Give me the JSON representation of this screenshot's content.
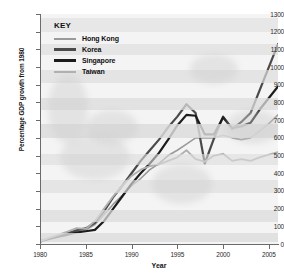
{
  "chart_data": {
    "type": "line",
    "title": "",
    "xlabel": "Year",
    "ylabel": "Percentage GDP growth from 1980",
    "xlim": [
      1980,
      2006
    ],
    "ylim": [
      0,
      1300
    ],
    "xticks": [
      "1980",
      "1985",
      "1990",
      "1995",
      "2000",
      "2005"
    ],
    "xtick_values": [
      1980,
      1985,
      1990,
      1995,
      2000,
      2005
    ],
    "yticks": [
      "0",
      "100",
      "200",
      "300",
      "400",
      "500",
      "600",
      "700",
      "800",
      "900",
      "1000",
      "1100",
      "1200",
      "1300"
    ],
    "ytick_values": [
      0,
      100,
      200,
      300,
      400,
      500,
      600,
      700,
      800,
      900,
      1000,
      1100,
      1200,
      1300
    ],
    "grid": "horizontal-bands",
    "legend_position": "top-left",
    "legend_title": "KEY",
    "x": [
      1980,
      1981,
      1982,
      1983,
      1984,
      1985,
      1986,
      1987,
      1988,
      1989,
      1990,
      1991,
      1992,
      1993,
      1994,
      1995,
      1996,
      1997,
      1998,
      1999,
      2000,
      2001,
      2002,
      2003,
      2004,
      2005,
      2006
    ],
    "series": [
      {
        "name": "Hong Kong",
        "color": "#9a9a9a",
        "width": 1.6,
        "values": [
          15,
          30,
          45,
          55,
          70,
          80,
          110,
          165,
          225,
          275,
          330,
          370,
          420,
          455,
          500,
          530,
          565,
          600,
          600,
          600,
          615,
          600,
          590,
          600,
          640,
          680,
          730
        ]
      },
      {
        "name": "Korea",
        "color": "#4a4a4a",
        "width": 2.2,
        "values": [
          15,
          32,
          48,
          60,
          78,
          88,
          120,
          185,
          265,
          330,
          400,
          470,
          530,
          590,
          660,
          720,
          790,
          740,
          455,
          595,
          720,
          650,
          690,
          740,
          870,
          1000,
          1130
        ]
      },
      {
        "name": "Singapore",
        "color": "#1c1c1c",
        "width": 2.2,
        "values": [
          15,
          28,
          42,
          52,
          65,
          72,
          80,
          130,
          200,
          270,
          340,
          400,
          455,
          515,
          590,
          670,
          730,
          725,
          620,
          620,
          715,
          655,
          665,
          685,
          760,
          825,
          890
        ]
      },
      {
        "name": "Taiwan",
        "color": "#b0b0b0",
        "width": 1.8,
        "values": [
          15,
          35,
          52,
          70,
          90,
          85,
          130,
          200,
          270,
          330,
          385,
          420,
          440,
          450,
          470,
          490,
          530,
          480,
          465,
          500,
          510,
          470,
          480,
          470,
          490,
          505,
          520
        ]
      }
    ]
  },
  "legend": {
    "title": "KEY",
    "items": [
      {
        "label": "Hong Kong",
        "color": "#9a9a9a",
        "thickness": 2
      },
      {
        "label": "Korea",
        "color": "#4a4a4a",
        "thickness": 3
      },
      {
        "label": "Singapore",
        "color": "#1c1c1c",
        "thickness": 3
      },
      {
        "label": "Taiwan",
        "color": "#b0b0b0",
        "thickness": 2
      }
    ]
  }
}
